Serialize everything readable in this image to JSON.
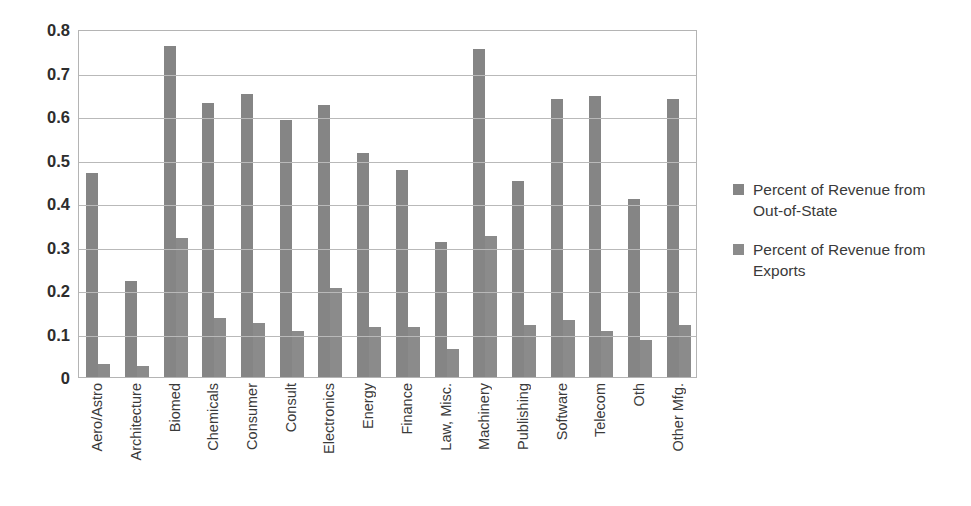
{
  "chart_data": {
    "type": "bar",
    "title": "",
    "xlabel": "",
    "ylabel": "",
    "ylim": [
      0,
      0.8
    ],
    "yticks": [
      "0",
      "0.1",
      "0.2",
      "0.3",
      "0.4",
      "0.5",
      "0.6",
      "0.7",
      "0.8"
    ],
    "ytick_values": [
      0,
      0.1,
      0.2,
      0.3,
      0.4,
      0.5,
      0.6,
      0.7,
      0.8
    ],
    "grid": true,
    "legend_position": "right",
    "categories": [
      "Aero/Astro",
      "Architecture",
      "Biomed",
      "Chemicals",
      "Consumer\nProducts",
      "Consult",
      "Electronics",
      "Energy",
      "Finance",
      "Law, Misc.",
      "Machinery",
      "Publishing",
      "Software",
      "Telecom",
      "Oth",
      "Other Mfg."
    ],
    "series": [
      {
        "name": "Percent of Revenue from Out-of-State",
        "color": "#858585",
        "values": [
          0.47,
          0.22,
          0.76,
          0.63,
          0.65,
          0.59,
          0.625,
          0.515,
          0.475,
          0.31,
          0.755,
          0.45,
          0.64,
          0.645,
          0.41,
          0.64
        ]
      },
      {
        "name": "Percent of Revenue from Exports",
        "color": "#8b8b8b",
        "values": [
          0.03,
          0.025,
          0.32,
          0.135,
          0.125,
          0.105,
          0.205,
          0.115,
          0.115,
          0.065,
          0.325,
          0.12,
          0.13,
          0.105,
          0.085,
          0.12
        ]
      }
    ]
  },
  "legend": {
    "items": [
      {
        "label": "Percent of Revenue from Out-of-State",
        "color": "#858585"
      },
      {
        "label": "Percent of Revenue from Exports",
        "color": "#8b8b8b"
      }
    ]
  }
}
